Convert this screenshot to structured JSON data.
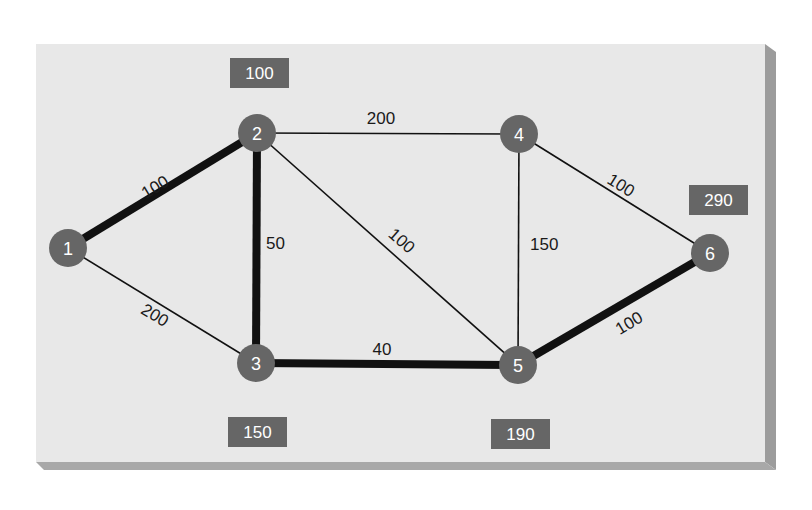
{
  "colors": {
    "panel": "#e8e8e8",
    "panel_shadow": "#9a9a9a",
    "node_fill": "#666666",
    "box_fill": "#666666",
    "edge": "#111111",
    "text_light": "#ffffff",
    "text_dark": "#1a1a1a"
  },
  "nodes": [
    {
      "id": "1",
      "label": "1",
      "x": 68,
      "y": 248
    },
    {
      "id": "2",
      "label": "2",
      "x": 257,
      "y": 133
    },
    {
      "id": "3",
      "label": "3",
      "x": 256,
      "y": 363
    },
    {
      "id": "4",
      "label": "4",
      "x": 519,
      "y": 134
    },
    {
      "id": "5",
      "label": "5",
      "x": 518,
      "y": 365
    },
    {
      "id": "6",
      "label": "6",
      "x": 710,
      "y": 253
    }
  ],
  "edges": [
    {
      "from": "1",
      "to": "2",
      "weight": "100",
      "bold": true
    },
    {
      "from": "1",
      "to": "3",
      "weight": "200",
      "bold": false
    },
    {
      "from": "2",
      "to": "3",
      "weight": "50",
      "bold": true
    },
    {
      "from": "2",
      "to": "4",
      "weight": "200",
      "bold": false
    },
    {
      "from": "2",
      "to": "5",
      "weight": "100",
      "bold": false
    },
    {
      "from": "3",
      "to": "5",
      "weight": "40",
      "bold": true
    },
    {
      "from": "4",
      "to": "5",
      "weight": "150",
      "bold": false
    },
    {
      "from": "4",
      "to": "6",
      "weight": "100",
      "bold": false
    },
    {
      "from": "5",
      "to": "6",
      "weight": "100",
      "bold": true
    }
  ],
  "distance_boxes": [
    {
      "node": "2",
      "value": "100"
    },
    {
      "node": "3",
      "value": "150"
    },
    {
      "node": "5",
      "value": "190"
    },
    {
      "node": "6",
      "value": "290"
    }
  ]
}
